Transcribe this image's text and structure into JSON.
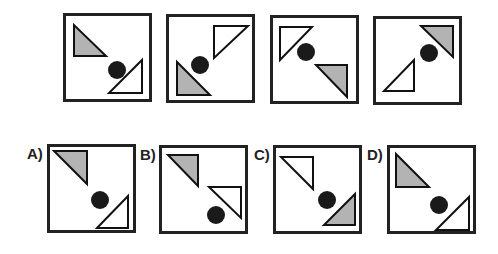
{
  "colors": {
    "gray_fill": "#b3b3b3",
    "white_fill": "#ffffff",
    "stroke": "#111111",
    "circle": "#1a1a1a",
    "border": "#222222"
  },
  "sequence": [
    {
      "id": "seq-1",
      "x": 63,
      "y": 13,
      "gray": "11,12 11,43 43,43",
      "white": "79,47 79,80 46,80",
      "circle": {
        "cx": 54,
        "cy": 57,
        "r": 9
      }
    },
    {
      "id": "seq-2",
      "x": 166,
      "y": 14,
      "gray": "11,48 11,81 44,81",
      "white": "48,12 82,12 48,44",
      "circle": {
        "cx": 34,
        "cy": 51,
        "r": 9
      }
    },
    {
      "id": "seq-3",
      "x": 270,
      "y": 15,
      "gray": "46,50 77,50 77,82",
      "white": "10,12 42,12 10,45",
      "circle": {
        "cx": 36,
        "cy": 37,
        "r": 9
      }
    },
    {
      "id": "seq-4",
      "x": 373,
      "y": 16,
      "gray": "48,10 80,10 80,41",
      "white": "11,75 41,75 41,44",
      "circle": {
        "cx": 56,
        "cy": 37,
        "r": 9
      }
    }
  ],
  "options": [
    {
      "label": "A)",
      "x": 47,
      "y": 144,
      "label_x": 27,
      "label_y": 146,
      "gray": "7,7 40,7 40,40",
      "white": "50,84 81,84 81,52",
      "circle": {
        "cx": 53,
        "cy": 56,
        "r": 9
      }
    },
    {
      "label": "B)",
      "x": 159,
      "y": 145,
      "label_x": 140,
      "label_y": 147,
      "gray": "9,10 39,10 39,41",
      "white": "50,42 82,42 82,73",
      "circle": {
        "cx": 57,
        "cy": 70,
        "r": 9
      }
    },
    {
      "label": "C)",
      "x": 273,
      "y": 145,
      "label_x": 254,
      "label_y": 147,
      "gray": "51,80 82,80 82,49",
      "white": "8,12 40,12 40,44",
      "circle": {
        "cx": 54,
        "cy": 55,
        "r": 9
      }
    },
    {
      "label": "D)",
      "x": 387,
      "y": 145,
      "label_x": 367,
      "label_y": 147,
      "gray": "9,9 9,42 42,42",
      "white": "49,85 82,85 82,52",
      "circle": {
        "cx": 52,
        "cy": 60,
        "r": 9
      }
    }
  ]
}
